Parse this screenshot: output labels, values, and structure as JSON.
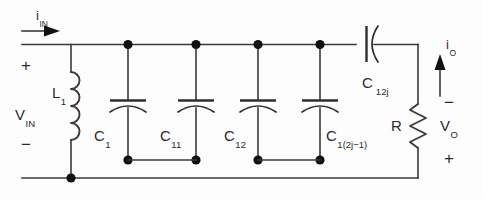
{
  "figure": {
    "name": "lc-ladder-network",
    "background_color": "#fdfdfd",
    "line_color": "#3a3a3a",
    "node_color": "#111111"
  },
  "currents": {
    "input": {
      "symbol": "i",
      "subscript": "IN",
      "direction": "right"
    },
    "output": {
      "symbol": "i",
      "subscript": "O",
      "direction": "up"
    }
  },
  "voltages": {
    "input": {
      "symbol": "V",
      "subscript": "IN",
      "plus": "+",
      "minus": "−"
    },
    "output": {
      "symbol": "V",
      "subscript": "O",
      "plus": "+",
      "minus": "−"
    }
  },
  "components": {
    "inductor": {
      "symbol": "L",
      "subscript": "1",
      "coils": 4
    },
    "resistor": {
      "symbol": "R",
      "subscript": ""
    },
    "series_capacitor": {
      "symbol": "C",
      "subscript": "12j"
    },
    "shunt_capacitors": [
      {
        "symbol": "C",
        "subscript": "1"
      },
      {
        "symbol": "C",
        "subscript": "11"
      },
      {
        "symbol": "C",
        "subscript": "12"
      },
      {
        "symbol": "C",
        "subscript": "1(2j−1)"
      }
    ]
  }
}
